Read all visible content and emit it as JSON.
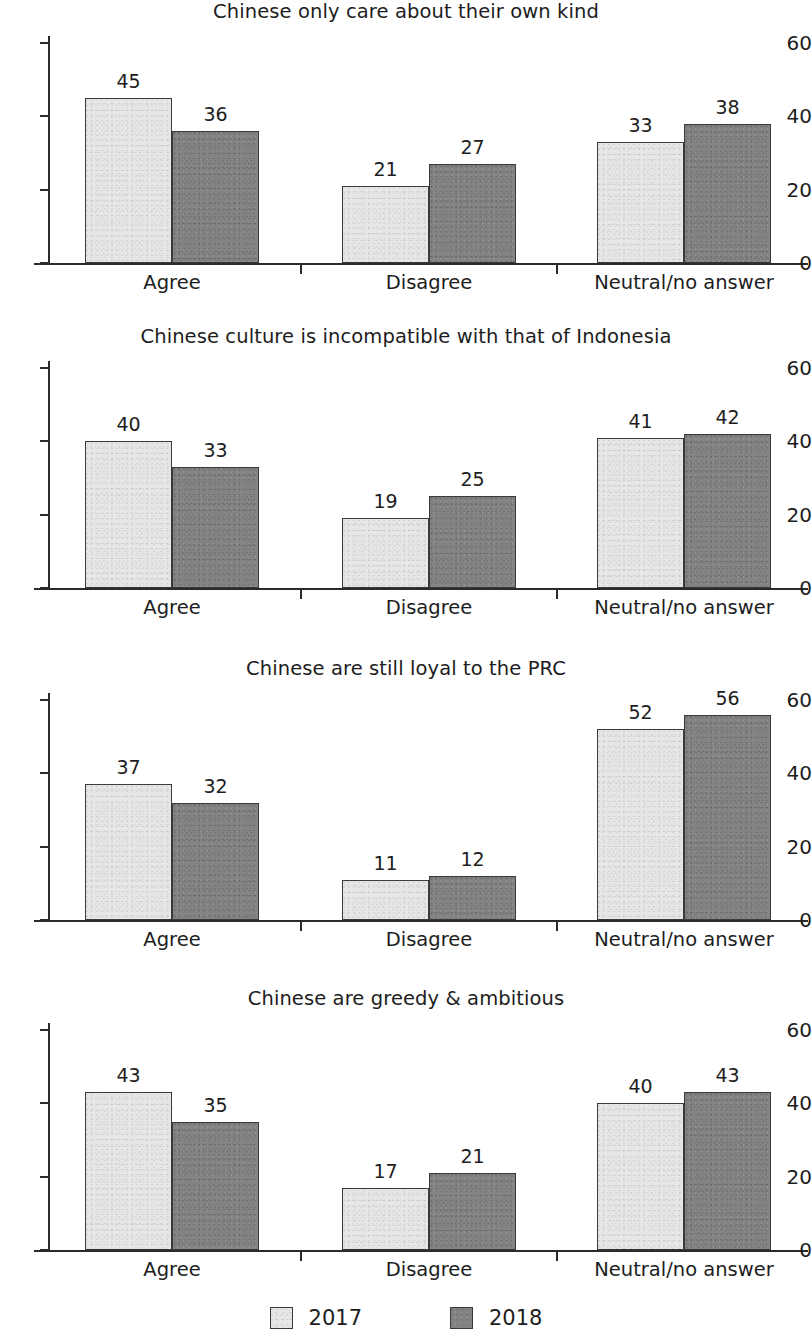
{
  "figure": {
    "background_color": "#ffffff",
    "axis_color": "#2b2b2b",
    "text_color": "#1d1d1d"
  },
  "legend": {
    "position": "bottom-center",
    "items": [
      {
        "label": "2017",
        "color": "#e6e6e6",
        "swatch_name": "legend-swatch-2017"
      },
      {
        "label": "2018",
        "color": "#838383",
        "swatch_name": "legend-swatch-2018"
      }
    ]
  },
  "axis": {
    "ytick_labels": [
      "0",
      "20",
      "40",
      "60"
    ],
    "ytick_values": [
      0,
      20,
      40,
      60
    ],
    "ylim": [
      0,
      60
    ],
    "categories": [
      "Agree",
      "Disagree",
      "Neutral/no answer"
    ]
  },
  "chart_data": [
    {
      "type": "bar",
      "title": "Chinese only care about their own kind",
      "xlabel": "",
      "ylabel": "",
      "ylim": [
        0,
        60
      ],
      "yticks": [
        0,
        20,
        40,
        60
      ],
      "grid": false,
      "legend_position": "figure-bottom",
      "categories": [
        "Agree",
        "Disagree",
        "Neutral/no answer"
      ],
      "series": [
        {
          "name": "2017",
          "color": "#e6e6e6",
          "values": [
            45,
            21,
            33
          ]
        },
        {
          "name": "2018",
          "color": "#838383",
          "values": [
            36,
            27,
            38
          ]
        }
      ]
    },
    {
      "type": "bar",
      "title": "Chinese culture is incompatible with that of Indonesia",
      "xlabel": "",
      "ylabel": "",
      "ylim": [
        0,
        60
      ],
      "yticks": [
        0,
        20,
        40,
        60
      ],
      "grid": false,
      "legend_position": "figure-bottom",
      "categories": [
        "Agree",
        "Disagree",
        "Neutral/no answer"
      ],
      "series": [
        {
          "name": "2017",
          "color": "#e6e6e6",
          "values": [
            40,
            19,
            41
          ]
        },
        {
          "name": "2018",
          "color": "#838383",
          "values": [
            33,
            25,
            42
          ]
        }
      ]
    },
    {
      "type": "bar",
      "title": "Chinese are still loyal to the PRC",
      "xlabel": "",
      "ylabel": "",
      "ylim": [
        0,
        60
      ],
      "yticks": [
        0,
        20,
        40,
        60
      ],
      "grid": false,
      "legend_position": "figure-bottom",
      "categories": [
        "Agree",
        "Disagree",
        "Neutral/no answer"
      ],
      "series": [
        {
          "name": "2017",
          "color": "#e6e6e6",
          "values": [
            37,
            11,
            52
          ]
        },
        {
          "name": "2018",
          "color": "#838383",
          "values": [
            32,
            12,
            56
          ]
        }
      ]
    },
    {
      "type": "bar",
      "title": "Chinese are greedy & ambitious",
      "xlabel": "",
      "ylabel": "",
      "ylim": [
        0,
        60
      ],
      "yticks": [
        0,
        20,
        40,
        60
      ],
      "grid": false,
      "legend_position": "figure-bottom",
      "categories": [
        "Agree",
        "Disagree",
        "Neutral/no answer"
      ],
      "series": [
        {
          "name": "2017",
          "color": "#e6e6e6",
          "values": [
            43,
            17,
            40
          ]
        },
        {
          "name": "2018",
          "color": "#838383",
          "values": [
            35,
            21,
            43
          ]
        }
      ]
    }
  ],
  "layout": {
    "panel_tops": [
      0,
      325,
      657,
      987
    ],
    "group_left_edges": [
      85,
      342,
      597
    ],
    "bar_width": 87,
    "separator_x": [
      300,
      556
    ],
    "axis_left": 48,
    "axis_right": 808,
    "baseline_y": 263,
    "top_value_y": 43
  }
}
